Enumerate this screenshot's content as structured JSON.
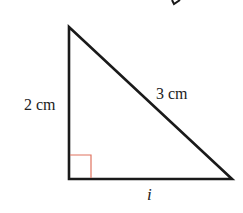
{
  "diagram": {
    "type": "right-triangle",
    "labels": {
      "left_side": "2 cm",
      "hypotenuse": "3 cm",
      "base": "i"
    },
    "colors": {
      "stroke": "#1a1a1a",
      "right_angle_marker": "#e0735f"
    }
  }
}
